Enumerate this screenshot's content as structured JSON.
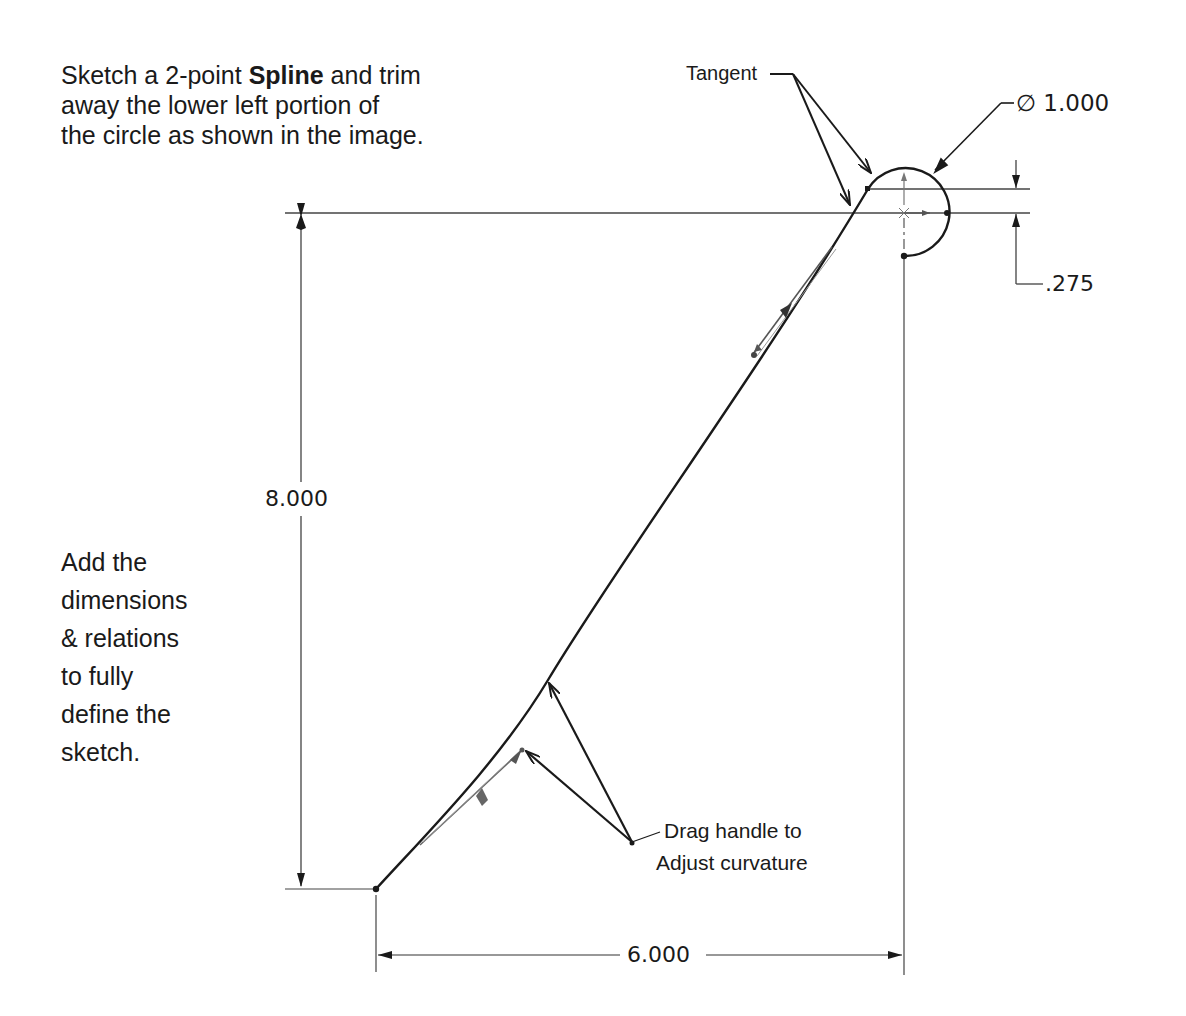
{
  "instructions": {
    "top": {
      "line1_prefix": "Sketch a 2-point ",
      "line1_bold": "Spline",
      "line1_suffix": " and trim",
      "line2": "away the lower left portion of",
      "line3": "the circle as shown in the image."
    },
    "left": {
      "lines": [
        "Add the",
        "dimensions",
        "& relations",
        "to fully",
        "define the",
        "sketch."
      ]
    }
  },
  "annotations": {
    "tangent": "Tangent",
    "drag_handle_line1": "Drag handle to",
    "drag_handle_line2": "Adjust curvature"
  },
  "dimensions": {
    "diameter": "∅ 1.000",
    "offset": ".275",
    "height": "8.000",
    "width": "6.000"
  },
  "colors": {
    "geometry": "#1a1a1a",
    "dimension": "#333333",
    "handle": "#666666",
    "background": "#ffffff"
  }
}
